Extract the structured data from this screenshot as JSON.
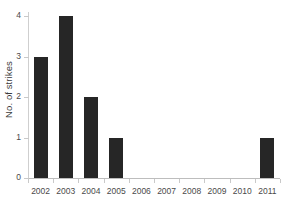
{
  "chart_data": {
    "type": "bar",
    "title": "",
    "xlabel": "",
    "ylabel": "No. of strikes",
    "categories": [
      "2002",
      "2003",
      "2004",
      "2005",
      "2006",
      "2007",
      "2008",
      "2009",
      "2010",
      "2011"
    ],
    "values": [
      3,
      4,
      2,
      1,
      0,
      0,
      0,
      0,
      0,
      1
    ],
    "ylim": [
      0,
      4
    ],
    "yticks": [
      "0",
      "1",
      "2",
      "3",
      "4"
    ],
    "ytick_values": [
      0,
      1,
      2,
      3,
      4
    ],
    "grid": false,
    "legend": null,
    "bar_color": "#262626",
    "axis_color": "#c9c9c9",
    "text_color": "#4a4a4a",
    "background": "#ffffff"
  }
}
